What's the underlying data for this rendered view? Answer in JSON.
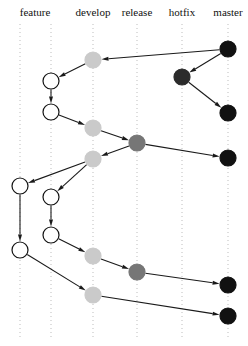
{
  "figure": {
    "kind": "git-branching-model-diagram",
    "width": 248,
    "height": 346,
    "background": "#ffffff"
  },
  "columns": [
    {
      "id": "feature-a",
      "label": "feature",
      "x": 20,
      "label_x": 35,
      "show_label": false,
      "gridline": true,
      "node_fill": "#ffffff",
      "node_stroke": "#111111"
    },
    {
      "id": "feature-b",
      "label": "feature",
      "x": 51,
      "label_x": 35,
      "show_label": true,
      "gridline": true,
      "node_fill": "#ffffff",
      "node_stroke": "#111111"
    },
    {
      "id": "develop",
      "label": "develop",
      "x": 93,
      "label_x": 93,
      "show_label": true,
      "gridline": true,
      "node_fill": "#cacaca",
      "node_stroke": "#cacaca"
    },
    {
      "id": "release",
      "label": "release",
      "x": 137,
      "label_x": 137,
      "show_label": true,
      "gridline": true,
      "node_fill": "#767676",
      "node_stroke": "#767676"
    },
    {
      "id": "hotfix",
      "label": "hotfix",
      "x": 182,
      "label_x": 182,
      "show_label": true,
      "gridline": true,
      "node_fill": "#2b2b2b",
      "node_stroke": "#2b2b2b"
    },
    {
      "id": "master",
      "label": "master",
      "x": 228,
      "label_x": 228,
      "show_label": true,
      "gridline": true,
      "node_fill": "#111111",
      "node_stroke": "#111111"
    }
  ],
  "header": {
    "y": 14,
    "labels": [
      "feature",
      "develop",
      "release",
      "hotfix",
      "master"
    ]
  },
  "grid": {
    "color": "#bdbdbd",
    "dash": "1,3",
    "width": 1,
    "y_top": 24,
    "y_bottom": 340
  },
  "node_style": {
    "radius": 8,
    "outline_width": 1.2
  },
  "edge_style": {
    "color": "#1a1a1a",
    "width": 1.1,
    "arrow_length": 7,
    "arrow_width": 4
  },
  "nodes": [
    {
      "id": "m1",
      "column": "master",
      "x": 228,
      "y": 49,
      "fill": "#111111",
      "stroke": "#111111"
    },
    {
      "id": "d1",
      "column": "develop",
      "x": 93,
      "y": 60,
      "fill": "#cacaca",
      "stroke": "#cacaca"
    },
    {
      "id": "h1",
      "column": "hotfix",
      "x": 182,
      "y": 77,
      "fill": "#2b2b2b",
      "stroke": "#2b2b2b"
    },
    {
      "id": "f1",
      "column": "feature-b",
      "x": 51,
      "y": 81,
      "fill": "#ffffff",
      "stroke": "#111111"
    },
    {
      "id": "f2",
      "column": "feature-b",
      "x": 51,
      "y": 112,
      "fill": "#ffffff",
      "stroke": "#111111"
    },
    {
      "id": "m2",
      "column": "master",
      "x": 228,
      "y": 113,
      "fill": "#111111",
      "stroke": "#111111"
    },
    {
      "id": "d2",
      "column": "develop",
      "x": 93,
      "y": 128,
      "fill": "#cacaca",
      "stroke": "#cacaca"
    },
    {
      "id": "r1",
      "column": "release",
      "x": 137,
      "y": 143,
      "fill": "#767676",
      "stroke": "#767676"
    },
    {
      "id": "m3",
      "column": "master",
      "x": 228,
      "y": 158,
      "fill": "#111111",
      "stroke": "#111111"
    },
    {
      "id": "d3",
      "column": "develop",
      "x": 93,
      "y": 159,
      "fill": "#cacaca",
      "stroke": "#cacaca"
    },
    {
      "id": "f3",
      "column": "feature-a",
      "x": 20,
      "y": 186,
      "fill": "#ffffff",
      "stroke": "#111111"
    },
    {
      "id": "f4",
      "column": "feature-b",
      "x": 51,
      "y": 197,
      "fill": "#ffffff",
      "stroke": "#111111"
    },
    {
      "id": "f5",
      "column": "feature-b",
      "x": 51,
      "y": 235,
      "fill": "#ffffff",
      "stroke": "#111111"
    },
    {
      "id": "f6",
      "column": "feature-a",
      "x": 20,
      "y": 250,
      "fill": "#ffffff",
      "stroke": "#111111"
    },
    {
      "id": "d4",
      "column": "develop",
      "x": 93,
      "y": 256,
      "fill": "#cacaca",
      "stroke": "#cacaca"
    },
    {
      "id": "r2",
      "column": "release",
      "x": 137,
      "y": 272,
      "fill": "#767676",
      "stroke": "#767676"
    },
    {
      "id": "m4",
      "column": "master",
      "x": 228,
      "y": 285,
      "fill": "#111111",
      "stroke": "#111111"
    },
    {
      "id": "d5",
      "column": "develop",
      "x": 93,
      "y": 295,
      "fill": "#cacaca",
      "stroke": "#cacaca"
    },
    {
      "id": "m5",
      "column": "master",
      "x": 228,
      "y": 316,
      "fill": "#111111",
      "stroke": "#111111"
    }
  ],
  "edges": [
    {
      "id": "e1",
      "from": "m1",
      "to": "d1"
    },
    {
      "id": "e2",
      "from": "m1",
      "to": "h1"
    },
    {
      "id": "e3",
      "from": "d1",
      "to": "f1"
    },
    {
      "id": "e4",
      "from": "h1",
      "to": "m2"
    },
    {
      "id": "e5",
      "from": "f1",
      "to": "f2"
    },
    {
      "id": "e6",
      "from": "f2",
      "to": "d2"
    },
    {
      "id": "e7",
      "from": "d2",
      "to": "r1"
    },
    {
      "id": "e8",
      "from": "r1",
      "to": "m3"
    },
    {
      "id": "e9",
      "from": "r1",
      "to": "d3"
    },
    {
      "id": "e10",
      "from": "d3",
      "to": "f3"
    },
    {
      "id": "e11",
      "from": "d3",
      "to": "f4"
    },
    {
      "id": "e12",
      "from": "f4",
      "to": "f5"
    },
    {
      "id": "e13",
      "from": "f3",
      "to": "f6"
    },
    {
      "id": "e14",
      "from": "f5",
      "to": "d4"
    },
    {
      "id": "e15",
      "from": "f6",
      "to": "d5"
    },
    {
      "id": "e16",
      "from": "d4",
      "to": "r2"
    },
    {
      "id": "e17",
      "from": "r2",
      "to": "m4"
    },
    {
      "id": "e18",
      "from": "d5",
      "to": "m5"
    }
  ]
}
